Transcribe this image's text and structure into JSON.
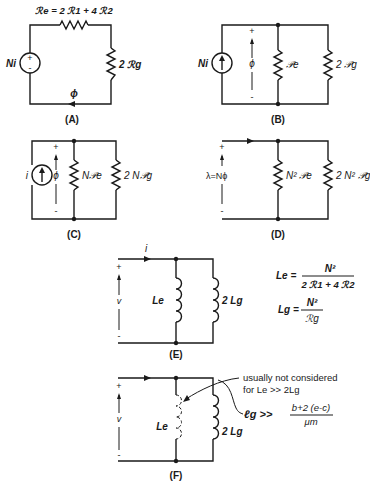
{
  "figure": {
    "panels": [
      {
        "id": "A",
        "caption": "(A)",
        "source_label": "Ni",
        "source_plus": "+",
        "source_minus": "-",
        "series_resistor_label": "ℛe = 2 ℛ1 + 4 ℛ2",
        "shunt_resistor_label": "2 ℛg",
        "flux_label": "ϕ"
      },
      {
        "id": "B",
        "caption": "(B)",
        "source_label": "Ni",
        "flux_label": "ϕ",
        "plus": "+",
        "minus": "-",
        "resistor1_label": "𝒫e",
        "resistor2_label": "2 𝒫g"
      },
      {
        "id": "C",
        "caption": "(C)",
        "source_label": "i",
        "flux_label": "ϕ",
        "plus": "+",
        "minus": "-",
        "resistor1_label": "N𝒫e",
        "resistor2_label": "2 N𝒫g"
      },
      {
        "id": "D",
        "caption": "(D)",
        "flux_label": "λ=Nϕ",
        "plus": "+",
        "minus": "-",
        "resistor1_label": "N² 𝒫e",
        "resistor2_label": "2 N² 𝒫g"
      },
      {
        "id": "E",
        "caption": "(E)",
        "current_label": "i",
        "voltage_label": "v",
        "plus": "+",
        "minus": "-",
        "inductor1_label": "Le",
        "inductor2_label": "2 Lg"
      },
      {
        "id": "F",
        "caption": "(F)",
        "voltage_label": "v",
        "plus": "+",
        "minus": "-",
        "inductor1_label": "Le",
        "inductor2_label": "2 Lg",
        "note_line1": "usually not considered",
        "note_line2": "for Le >> 2Lg",
        "condition_lhs": "ℓg >>",
        "condition_num": "b+2 (e-c)",
        "condition_den": "μm"
      }
    ],
    "equations": {
      "le_lhs": "Le =",
      "le_num": "N²",
      "le_den": "2 ℛ1 + 4 ℛ2",
      "lg_lhs": "Lg =",
      "lg_num": "N²",
      "lg_den": "ℛg"
    }
  }
}
